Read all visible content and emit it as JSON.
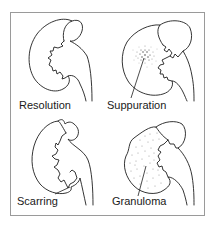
{
  "diagram": {
    "panels": [
      {
        "id": "resolution",
        "label": "Resolution"
      },
      {
        "id": "suppuration",
        "label": "Suppuration"
      },
      {
        "id": "scarring",
        "label": "Scarring"
      },
      {
        "id": "granuloma",
        "label": "Granuloma"
      }
    ]
  },
  "colors": {
    "line": "#1e1e1e",
    "frame": "#9a9a9a",
    "background": "#ffffff"
  }
}
